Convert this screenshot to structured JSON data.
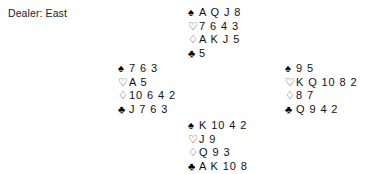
{
  "diagram": {
    "dealer_text": "Dealer: East",
    "suits": [
      {
        "key": "spades",
        "icon": "spade-icon",
        "glyph": "♠",
        "style": "black"
      },
      {
        "key": "hearts",
        "icon": "heart-icon",
        "glyph": "♡",
        "style": "outline"
      },
      {
        "key": "diamonds",
        "icon": "diamond-icon",
        "glyph": "♢",
        "style": "outline"
      },
      {
        "key": "clubs",
        "icon": "club-icon",
        "glyph": "♣",
        "style": "black"
      }
    ],
    "hands": {
      "north": {
        "position": "North",
        "spades": "A Q J 8",
        "hearts": "7 6 4 3",
        "diamonds": "A K J 5",
        "clubs": "5"
      },
      "west": {
        "position": "West",
        "spades": "7 6 3",
        "hearts": "A 5",
        "diamonds": "10 6 4 2",
        "clubs": "J 7 6 3"
      },
      "east": {
        "position": "East",
        "spades": "9 5",
        "hearts": "K Q 10 8 2",
        "diamonds": "8 7",
        "clubs": "Q 9 4 2"
      },
      "south": {
        "position": "South",
        "spades": "K 10 4 2",
        "hearts": "J 9",
        "diamonds": "Q 9 3",
        "clubs": "A K 10 8"
      }
    }
  }
}
